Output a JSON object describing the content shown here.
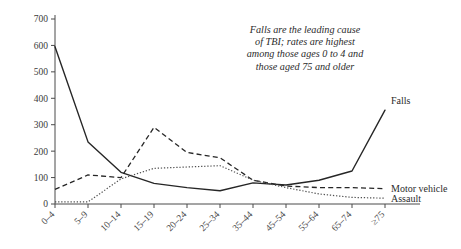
{
  "chart_data": {
    "type": "line",
    "title": "",
    "subtitle": "",
    "xlabel": "",
    "ylabel": "",
    "ylim": [
      0,
      700
    ],
    "yticks": [
      0,
      100,
      200,
      300,
      400,
      500,
      600,
      700
    ],
    "grid": false,
    "legend_position": "inline-right-end",
    "categories": [
      "0–4",
      "5–9",
      "10–14",
      "15–19",
      "20–24",
      "25–34",
      "35–44",
      "45–54",
      "55–64",
      "65–74",
      "≥75"
    ],
    "series": [
      {
        "name": "Falls",
        "style": "solid",
        "values": [
          595,
          235,
          120,
          78,
          62,
          50,
          80,
          72,
          90,
          125,
          355
        ]
      },
      {
        "name": "Motor vehicle",
        "style": "dashed",
        "values": [
          55,
          110,
          100,
          290,
          195,
          175,
          90,
          68,
          62,
          62,
          58
        ]
      },
      {
        "name": "Assault",
        "style": "dotted",
        "values": [
          8,
          8,
          95,
          135,
          140,
          145,
          90,
          62,
          38,
          25,
          22
        ]
      }
    ],
    "annotation": {
      "lines": [
        "Falls are the leading cause",
        "of TBI; rates are highest",
        "among those ages 0 to 4 and",
        "those aged 75 and older"
      ]
    }
  },
  "colors": {
    "axis": "#4a4a4a",
    "falls": "#262626",
    "motor_vehicle": "#262626",
    "assault": "#4f4f4f",
    "background": "#ffffff"
  }
}
